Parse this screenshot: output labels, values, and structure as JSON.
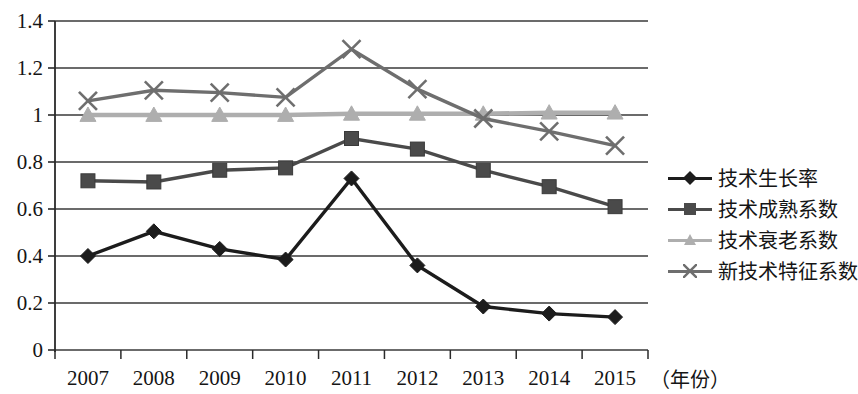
{
  "chart_data": {
    "type": "line",
    "title": "",
    "xlabel": "（年份）",
    "ylabel": "",
    "x": [
      "2007",
      "2008",
      "2009",
      "2010",
      "2011",
      "2012",
      "2013",
      "2014",
      "2015"
    ],
    "categories": [
      "2007",
      "2008",
      "2009",
      "2010",
      "2011",
      "2012",
      "2013",
      "2014",
      "2015"
    ],
    "ylim": [
      0,
      1.4
    ],
    "yticks": [
      "0",
      "0.2",
      "0.4",
      "0.6",
      "0.8",
      "1",
      "1.2",
      "1.4"
    ],
    "ytick_values": [
      0,
      0.2,
      0.4,
      0.6,
      0.8,
      1.0,
      1.2,
      1.4
    ],
    "grid": true,
    "legend_position": "right",
    "series": [
      {
        "name": "技术生长率",
        "marker": "diamond",
        "color": "#1c1c1c",
        "values": [
          0.4,
          0.505,
          0.43,
          0.385,
          0.73,
          0.36,
          0.185,
          0.155,
          0.14
        ]
      },
      {
        "name": "技术成熟系数",
        "marker": "square",
        "color": "#4a4a4a",
        "values": [
          0.72,
          0.715,
          0.765,
          0.775,
          0.9,
          0.855,
          0.765,
          0.695,
          0.61
        ]
      },
      {
        "name": "技术衰老系数",
        "marker": "triangle",
        "color": "#aeaeae",
        "values": [
          1.0,
          1.0,
          1.0,
          1.0,
          1.005,
          1.005,
          1.005,
          1.01,
          1.01
        ]
      },
      {
        "name": "新技术特征系数",
        "marker": "cross",
        "color": "#6e6e6e",
        "values": [
          1.06,
          1.105,
          1.095,
          1.075,
          1.28,
          1.11,
          0.985,
          0.93,
          0.87
        ]
      }
    ]
  },
  "axes": {
    "x_unit_label": "（年份）"
  }
}
